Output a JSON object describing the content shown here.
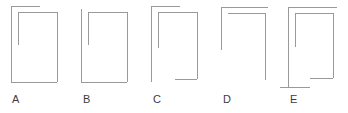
{
  "figure": {
    "background_color": "#ffffff",
    "stroke_color": "#9a9a9a",
    "label_color": "#3d3d3d",
    "stroke_width": 1,
    "canvas": {
      "width": 348,
      "height": 113
    },
    "options": [
      {
        "id": "A",
        "label": "A",
        "label_x": 12,
        "label_y": 103,
        "description": "Rectangle with an outer top-left overhanging horizontal line, an inner short vertical stub at upper left, and a complete bottom line.",
        "segments": [
          {
            "name": "top-overhang-line",
            "x1": 11,
            "y1": 6,
            "x2": 40,
            "y2": 6
          },
          {
            "name": "outer-left-vertical",
            "x1": 11,
            "y1": 6,
            "x2": 11,
            "y2": 82
          },
          {
            "name": "inner-top-horizontal",
            "x1": 18,
            "y1": 12,
            "x2": 57,
            "y2": 12
          },
          {
            "name": "inner-left-vertical-stub",
            "x1": 18,
            "y1": 12,
            "x2": 18,
            "y2": 45
          },
          {
            "name": "right-vertical",
            "x1": 57,
            "y1": 12,
            "x2": 57,
            "y2": 82
          },
          {
            "name": "bottom-horizontal",
            "x1": 11,
            "y1": 82,
            "x2": 57,
            "y2": 82
          }
        ]
      },
      {
        "id": "B",
        "label": "B",
        "label_x": 83,
        "label_y": 103,
        "description": "Rectangle with no top-left overhang, an inner short vertical stub at upper left, and a complete bottom line.",
        "segments": [
          {
            "name": "outer-left-vertical",
            "x1": 81,
            "y1": 9,
            "x2": 81,
            "y2": 82
          },
          {
            "name": "inner-top-horizontal",
            "x1": 88,
            "y1": 12,
            "x2": 127,
            "y2": 12
          },
          {
            "name": "inner-left-vertical-stub",
            "x1": 88,
            "y1": 12,
            "x2": 88,
            "y2": 45
          },
          {
            "name": "right-vertical",
            "x1": 127,
            "y1": 12,
            "x2": 127,
            "y2": 82
          },
          {
            "name": "bottom-horizontal",
            "x1": 81,
            "y1": 82,
            "x2": 127,
            "y2": 82
          }
        ]
      },
      {
        "id": "C",
        "label": "C",
        "label_x": 153,
        "label_y": 103,
        "description": "Rectangle with an outer top-left overhanging horizontal line, an inner short vertical stub, and a bottom line covering only the right portion.",
        "segments": [
          {
            "name": "top-overhang-line",
            "x1": 151,
            "y1": 6,
            "x2": 180,
            "y2": 6
          },
          {
            "name": "outer-left-vertical",
            "x1": 151,
            "y1": 6,
            "x2": 151,
            "y2": 82
          },
          {
            "name": "inner-top-horizontal",
            "x1": 158,
            "y1": 12,
            "x2": 197,
            "y2": 12
          },
          {
            "name": "inner-left-vertical-stub",
            "x1": 158,
            "y1": 12,
            "x2": 158,
            "y2": 48
          },
          {
            "name": "right-vertical",
            "x1": 197,
            "y1": 12,
            "x2": 197,
            "y2": 79
          },
          {
            "name": "partial-bottom-horizontal",
            "x1": 175,
            "y1": 79,
            "x2": 197,
            "y2": 79
          }
        ]
      },
      {
        "id": "D",
        "label": "D",
        "label_x": 223,
        "label_y": 103,
        "description": "Open shape with a top horizontal line overhanging right, a short left vertical, a full right vertical, and no bottom line.",
        "segments": [
          {
            "name": "top-overhang-line",
            "x1": 221,
            "y1": 7,
            "x2": 268,
            "y2": 7
          },
          {
            "name": "outer-left-vertical-short",
            "x1": 221,
            "y1": 7,
            "x2": 221,
            "y2": 50
          },
          {
            "name": "inner-top-horizontal",
            "x1": 228,
            "y1": 13,
            "x2": 265,
            "y2": 13
          },
          {
            "name": "right-vertical",
            "x1": 265,
            "y1": 13,
            "x2": 265,
            "y2": 80
          }
        ]
      },
      {
        "id": "E",
        "label": "E",
        "label_x": 290,
        "label_y": 103,
        "description": "Rectangle with an inner vertical stub, an inner bottom-right horizontal segment, and a bottom line that overhangs to the left.",
        "segments": [
          {
            "name": "top-horizontal",
            "x1": 288,
            "y1": 7,
            "x2": 337,
            "y2": 7
          },
          {
            "name": "outer-left-vertical",
            "x1": 288,
            "y1": 7,
            "x2": 288,
            "y2": 87
          },
          {
            "name": "inner-top-horizontal",
            "x1": 295,
            "y1": 13,
            "x2": 333,
            "y2": 13
          },
          {
            "name": "inner-left-vertical-stub",
            "x1": 295,
            "y1": 13,
            "x2": 295,
            "y2": 47
          },
          {
            "name": "right-vertical",
            "x1": 333,
            "y1": 13,
            "x2": 333,
            "y2": 78
          },
          {
            "name": "inner-bottom-horizontal",
            "x1": 310,
            "y1": 78,
            "x2": 333,
            "y2": 78
          },
          {
            "name": "bottom-overhang-line",
            "x1": 280,
            "y1": 87,
            "x2": 310,
            "y2": 87
          }
        ]
      }
    ]
  }
}
